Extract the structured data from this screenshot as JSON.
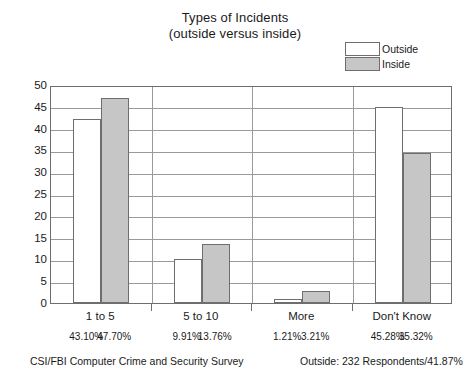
{
  "chart_data": {
    "type": "bar",
    "title": "Types of Incidents",
    "subtitle": "(outside versus inside)",
    "categories": [
      "1 to 5",
      "5 to 10",
      "More",
      "Don't Know"
    ],
    "series": [
      {
        "name": "Outside",
        "values": [
          42.2,
          10,
          1,
          45
        ],
        "color": "#ffffff"
      },
      {
        "name": "Inside",
        "values": [
          47,
          13.5,
          2.8,
          34.5
        ],
        "color": "#c6c6c6"
      }
    ],
    "percent_labels": {
      "outside": [
        "43.10%",
        "9.91%",
        "1.21%",
        "45.28%"
      ],
      "inside": [
        "47.70%",
        "13.76%",
        "3.21%",
        "35.32%"
      ]
    },
    "xlabel": "",
    "ylabel": "",
    "ylim": [
      0,
      50
    ],
    "yticks": [
      0,
      5,
      10,
      15,
      20,
      25,
      30,
      35,
      40,
      45,
      50
    ],
    "grid": true,
    "legend_position": "top-right"
  },
  "legend": {
    "items": [
      {
        "label": "Outside",
        "swatch": "white"
      },
      {
        "label": "Inside",
        "swatch": "gray"
      }
    ]
  },
  "footer": {
    "left": "CSI/FBI Computer Crime and Security Survey",
    "right": "Outside: 232 Respondents/41.87%"
  }
}
